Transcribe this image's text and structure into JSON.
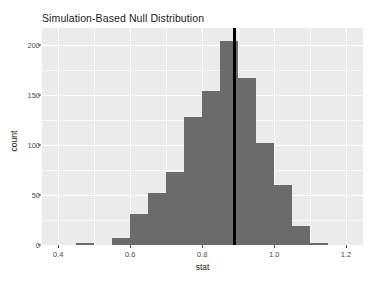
{
  "chart_data": {
    "type": "bar",
    "title": "Simulation-Based Null Distribution",
    "xlabel": "stat",
    "ylabel": "count",
    "xlim": [
      0.355,
      1.247
    ],
    "ylim": [
      0,
      217
    ],
    "grid": true,
    "legend": null,
    "bin_width": 0.05,
    "bin_starts": [
      0.45,
      0.5,
      0.55,
      0.6,
      0.65,
      0.7,
      0.75,
      0.8,
      0.85,
      0.9,
      0.95,
      1.0,
      1.05,
      1.1,
      1.15,
      1.2
    ],
    "categories": [
      "0.45-0.50",
      "0.50-0.55",
      "0.55-0.60",
      "0.60-0.65",
      "0.65-0.70",
      "0.70-0.75",
      "0.75-0.80",
      "0.80-0.85",
      "0.85-0.90",
      "0.90-0.95",
      "0.95-1.00",
      "1.00-1.05",
      "1.05-1.10",
      "1.10-1.15",
      "1.15-1.20",
      "1.20-1.25"
    ],
    "values": [
      2,
      0,
      7,
      31,
      52,
      73,
      128,
      154,
      204,
      167,
      102,
      60,
      19,
      2,
      0,
      0
    ],
    "x_ticks": [
      0.4,
      0.6,
      0.8,
      1.0,
      1.2
    ],
    "x_tick_labels": [
      "0.4",
      "0.6",
      "0.8",
      "1.0",
      "1.2"
    ],
    "x_minor_ticks": [
      0.5,
      0.7,
      0.9,
      1.1
    ],
    "y_ticks": [
      0,
      50,
      100,
      150,
      200
    ],
    "y_tick_labels": [
      "0",
      "50",
      "100",
      "150",
      "200"
    ],
    "y_minor_ticks": [
      25,
      75,
      125,
      175
    ],
    "annotations": [
      {
        "name": "observed-statistic-line",
        "type": "vline",
        "x": 0.89,
        "color": "#000000"
      }
    ],
    "colors": {
      "bar_fill": "#6b6b6b",
      "panel_background": "#ebebeb",
      "grid_line": "#ffffff",
      "axis_text": "#4d4d4d",
      "title_text": "#1a1a1a",
      "plot_background": "#ffffff"
    }
  }
}
